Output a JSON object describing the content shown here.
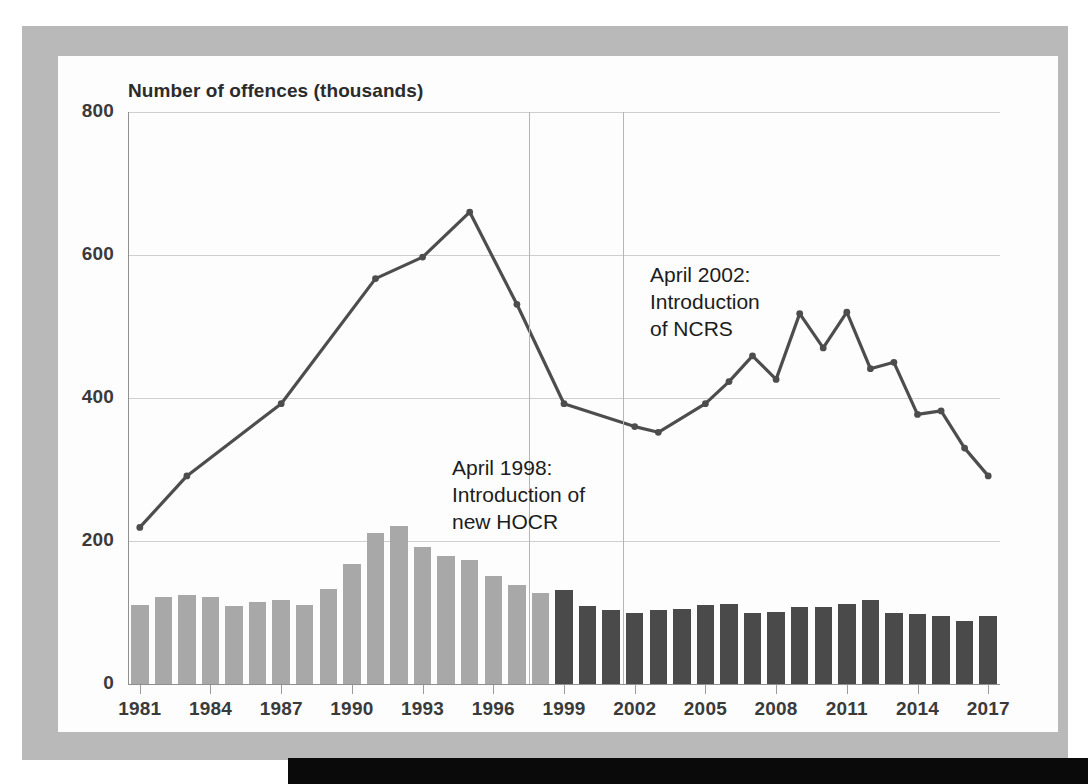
{
  "figure": {
    "title": "Number of offences (thousands)",
    "annotations": [
      {
        "name": "hocr",
        "text": "April 1998:\nIntroduction of\nnew HOCR",
        "year": 1998
      },
      {
        "name": "ncrs",
        "text": "April 2002:\nIntroduction\nof NCRS",
        "year": 2002
      }
    ]
  },
  "colors": {
    "bar_light": "#a8a8a8",
    "bar_dark": "#4a4a4a",
    "line": "#4d4d4d",
    "grid": "#cfcfcf",
    "frame": "#b9b9b9",
    "band": "#0a0a0a"
  },
  "chart_data": {
    "type": "bar",
    "title": "Number of offences (thousands)",
    "xlabel": "",
    "ylabel": "Number of offences (thousands)",
    "ylim": [
      0,
      800
    ],
    "yticks": [
      0,
      200,
      400,
      600,
      800
    ],
    "ytick_labels": [
      "0",
      "200",
      "400",
      "600",
      "800"
    ],
    "xticks": [
      1981,
      1984,
      1987,
      1990,
      1993,
      1996,
      1999,
      2002,
      2005,
      2008,
      2011,
      2014,
      2017
    ],
    "xtick_labels": [
      "1981",
      "1984",
      "1987",
      "1990",
      "1993",
      "1996",
      "1999",
      "2002",
      "2005",
      "2008",
      "2011",
      "2014",
      "2017"
    ],
    "x": [
      1981,
      1982,
      1983,
      1984,
      1985,
      1986,
      1987,
      1988,
      1989,
      1990,
      1991,
      1992,
      1993,
      1994,
      1995,
      1996,
      1997,
      1998,
      1999,
      2000,
      2001,
      2002,
      2003,
      2004,
      2005,
      2006,
      2007,
      2008,
      2009,
      2010,
      2011,
      2012,
      2013,
      2014,
      2015,
      2016,
      2017
    ],
    "grid": true,
    "legend_position": "none",
    "series": [
      {
        "name": "Offences (bars)",
        "type": "bar",
        "segments": [
          {
            "name": "pre-HOCR (light)",
            "color": "#a8a8a8",
            "years": [
              1981,
              1982,
              1983,
              1984,
              1985,
              1986,
              1987,
              1988,
              1989,
              1990,
              1991,
              1992,
              1993,
              1994,
              1995,
              1996,
              1997,
              1998
            ]
          },
          {
            "name": "post-HOCR (dark)",
            "color": "#4a4a4a",
            "years": [
              1999,
              2000,
              2001,
              2002,
              2003,
              2004,
              2005,
              2006,
              2007,
              2008,
              2009,
              2010,
              2011,
              2012,
              2013,
              2014,
              2015,
              2016,
              2017
            ]
          }
        ],
        "values": [
          110,
          122,
          124,
          122,
          109,
          114,
          118,
          110,
          133,
          168,
          211,
          221,
          191,
          179,
          174,
          151,
          138,
          127,
          131,
          109,
          104,
          100,
          103,
          105,
          110,
          112,
          100,
          101,
          108,
          108,
          112,
          117,
          100,
          98,
          95,
          88,
          95
        ]
      },
      {
        "name": "Offences (line)",
        "type": "line",
        "color": "#4d4d4d",
        "marker": "circle",
        "values": [
          219,
          291,
          340,
          392,
          443,
          490,
          524,
          567,
          596,
          660,
          530,
          null,
          null,
          null,
          null,
          null,
          null,
          null,
          null,
          null,
          null,
          null,
          null,
          null,
          null,
          null,
          null,
          null,
          null,
          null,
          null,
          null,
          null,
          null,
          null,
          null,
          null
        ],
        "points": [
          {
            "x": 1981,
            "y": 219
          },
          {
            "x": 1983,
            "y": 291
          },
          {
            "x": 1987,
            "y": 392
          },
          {
            "x": 1991,
            "y": 567
          },
          {
            "x": 1993,
            "y": 597
          },
          {
            "x": 1995,
            "y": 660
          },
          {
            "x": 1997,
            "y": 531
          },
          {
            "x": 1999,
            "y": 392
          },
          {
            "x": 2002,
            "y": 360
          },
          {
            "x": 2003,
            "y": 352
          },
          {
            "x": 2005,
            "y": 392
          },
          {
            "x": 2006,
            "y": 423
          },
          {
            "x": 2007,
            "y": 459
          },
          {
            "x": 2008,
            "y": 426
          },
          {
            "x": 2009,
            "y": 518
          },
          {
            "x": 2010,
            "y": 470
          },
          {
            "x": 2011,
            "y": 520
          },
          {
            "x": 2012,
            "y": 441
          },
          {
            "x": 2013,
            "y": 450
          },
          {
            "x": 2014,
            "y": 377
          },
          {
            "x": 2015,
            "y": 382
          },
          {
            "x": 2016,
            "y": 330
          },
          {
            "x": 2017,
            "y": 291
          }
        ]
      }
    ],
    "vertical_markers": [
      {
        "year": 1998,
        "label": "April 1998: Introduction of new HOCR"
      },
      {
        "year": 2002,
        "label": "April 2002: Introduction of NCRS"
      }
    ]
  }
}
